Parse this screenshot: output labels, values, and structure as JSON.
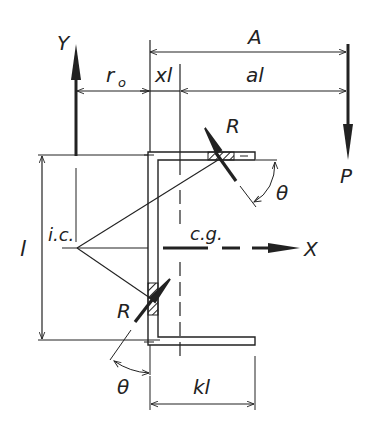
{
  "diagram": {
    "type": "eccentrically loaded weld group on channel section",
    "labels": {
      "y_axis": "Y",
      "x_axis": "X",
      "dim_A": "A",
      "dim_r0": "r",
      "dim_r0_sub": "o",
      "dim_xl": "xl",
      "dim_al": "al",
      "load_P": "P",
      "force_R_top": "R",
      "force_R_bottom": "R",
      "angle_top": "θ",
      "angle_bottom": "θ",
      "instant_center": "i.c.",
      "center_gravity": "c.g.",
      "dim_l": "l",
      "dim_kl": "kl"
    },
    "colors": {
      "ink": "#222222",
      "background": "#ffffff"
    }
  }
}
